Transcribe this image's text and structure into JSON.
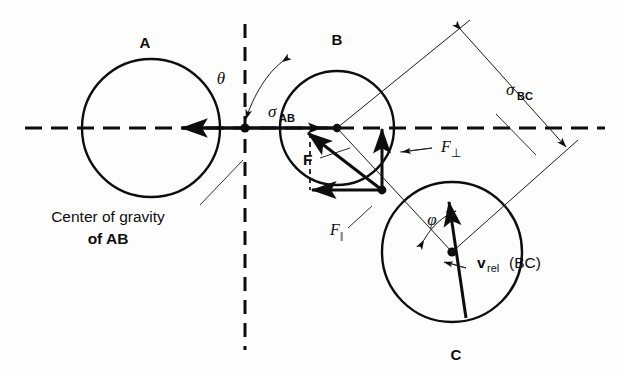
{
  "figure": {
    "background_color": "#fdfdfd",
    "stroke_color": "#0d0d0d"
  },
  "labels": {
    "circle_a": "A",
    "circle_b": "B",
    "circle_c": "C",
    "theta": "θ",
    "phi": "φ",
    "sigma_ab_symbol": "σ",
    "sigma_ab_sub": "AB",
    "sigma_bc_symbol": "σ",
    "sigma_bc_sub": "BC",
    "force_f": "F",
    "force_perp_symbol": "F",
    "force_perp_sub": "⊥",
    "force_par_symbol": "F",
    "force_par_sub": "‖",
    "v_rel_symbol": "v",
    "v_rel_sub": "rel",
    "v_rel_arg": "(BC)",
    "center_gravity_line1": "Center of gravity",
    "center_gravity_line2": "of AB"
  },
  "geometry": {
    "circle_a": {
      "cx": 151,
      "cy": 128,
      "r": 69
    },
    "circle_b": {
      "cx": 337,
      "cy": 128,
      "r": 57
    },
    "circle_c": {
      "cx": 452,
      "cy": 252,
      "r": 70
    },
    "center_of_gravity_ab": {
      "x": 245,
      "y": 128
    },
    "contact_point_bc": {
      "x": 382,
      "y": 190
    },
    "horizontal_axis": {
      "x1": 25,
      "y1": 128,
      "x2": 605,
      "y2": 128
    },
    "vertical_axis": {
      "x": 245,
      "y1": 24,
      "y2": 350
    }
  }
}
